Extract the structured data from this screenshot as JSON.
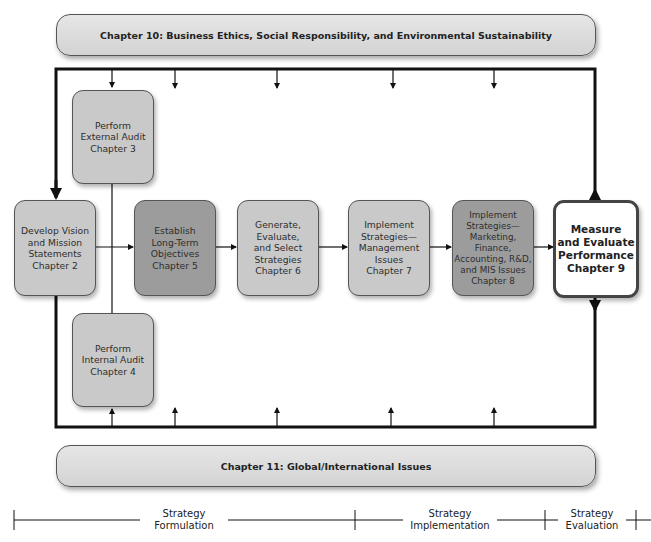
{
  "diagram": {
    "title_top_banner": "Chapter 10: Business Ethics, Social Responsibility, and Environmental Sustainability",
    "title_bottom_banner": "Chapter 11:  Global/International Issues",
    "nodes": [
      {
        "id": "vision",
        "lines": [
          "Develop Vision",
          "and Mission",
          "Statements",
          "Chapter 2"
        ]
      },
      {
        "id": "external",
        "lines": [
          "Perform",
          "External Audit",
          "Chapter 3"
        ]
      },
      {
        "id": "internal",
        "lines": [
          "Perform",
          "Internal Audit",
          "Chapter 4"
        ]
      },
      {
        "id": "objectives",
        "lines": [
          "Establish",
          "Long-Term",
          "Objectives",
          "Chapter 5"
        ]
      },
      {
        "id": "generate",
        "lines": [
          "Generate,",
          "Evaluate,",
          "and Select",
          "Strategies",
          "Chapter 6"
        ]
      },
      {
        "id": "implement_mgmt",
        "lines": [
          "Implement",
          "Strategies—",
          "Management",
          "Issues",
          "Chapter 7"
        ]
      },
      {
        "id": "implement_mkt",
        "lines": [
          "Implement",
          "Strategies—",
          "Marketing,",
          "Finance,",
          "Accounting, R&D,",
          "and MIS Issues",
          "Chapter 8"
        ]
      },
      {
        "id": "measure",
        "lines": [
          "Measure",
          "and Evaluate",
          "Performance",
          "Chapter 9"
        ]
      }
    ],
    "phases": [
      {
        "lines": [
          "Strategy",
          "Formulation"
        ]
      },
      {
        "lines": [
          "Strategy",
          "Implementation"
        ]
      },
      {
        "lines": [
          "Strategy",
          "Evaluation"
        ]
      }
    ]
  },
  "text": {
    "vision": "Develop Vision\nand Mission\nStatements\nChapter 2",
    "external": "Perform\nExternal Audit\nChapter 3",
    "internal": "Perform\nInternal Audit\nChapter 4",
    "objectives": "Establish\nLong-Term\nObjectives\nChapter 5",
    "generate": "Generate,\nEvaluate,\nand Select\nStrategies\nChapter 6",
    "implement_mgmt": "Implement\nStrategies—\nManagement\nIssues\nChapter 7",
    "implement_mkt": "Implement\nStrategies—\nMarketing,\nFinance,\nAccounting, R&D,\nand MIS Issues\nChapter 8",
    "measure": "Measure\nand Evaluate\nPerformance\nChapter 9",
    "phase_formulation": "Strategy\nFormulation",
    "phase_implementation": "Strategy\nImplementation",
    "phase_evaluation": "Strategy\nEvaluation"
  },
  "colors": {
    "light_box": "#c9c9c9",
    "mid_box": "#b4b4b4",
    "dark_box": "#9c9c9c",
    "line": "#111111"
  }
}
